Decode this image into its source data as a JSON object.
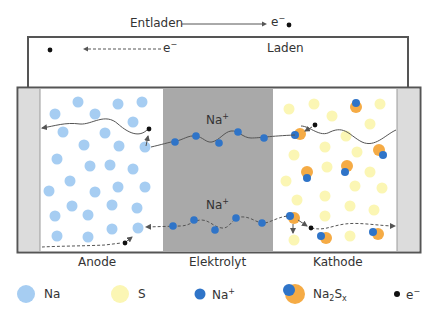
{
  "diagram": {
    "external_circuit": {
      "discharge_label": "Entladen",
      "charge_label": "Laden",
      "electron_label": "e",
      "electron_charge": "−"
    },
    "regions": {
      "anode": "Anode",
      "electrolyte": "Elektrolyt",
      "cathode": "Kathode"
    },
    "ion_labels": {
      "top": "Na",
      "top_charge": "+",
      "bottom": "Na",
      "bottom_charge": "+"
    },
    "legend": [
      {
        "symbol": "na-atom",
        "label": "Na",
        "sub": "",
        "sup": "",
        "color": "#a6cdf2"
      },
      {
        "symbol": "s-atom",
        "label": "S",
        "sub": "",
        "sup": "",
        "color": "#fbf6b4"
      },
      {
        "symbol": "na-ion",
        "label": "Na",
        "sub": "",
        "sup": "+",
        "color": "#2f74c8"
      },
      {
        "symbol": "na2sx",
        "label": "Na",
        "sub": "2",
        "label2": "S",
        "sub2": "x",
        "color": "#f5ab45"
      },
      {
        "symbol": "electron",
        "label": "e",
        "sub": "",
        "sup": "−",
        "color": "#111111"
      }
    ],
    "colors": {
      "na": "#a6cdf2",
      "s": "#fbf6b4",
      "na_ion": "#2f74c8",
      "na2sx": "#f5ab45",
      "electron": "#111111",
      "electrolyte": "#a9a9a9",
      "collector": "#dcdcdc",
      "frame": "#555555"
    }
  }
}
